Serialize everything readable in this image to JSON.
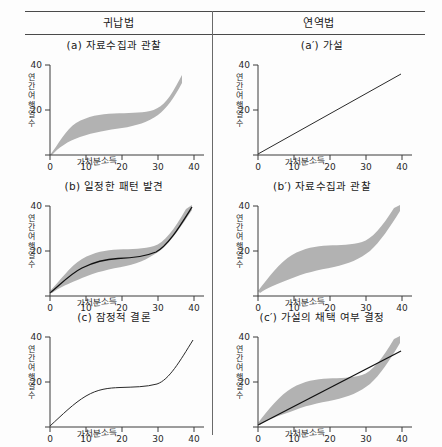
{
  "figure": {
    "columns": [
      {
        "id": "induction",
        "header": "귀납법"
      },
      {
        "id": "deduction",
        "header": "연역법"
      }
    ]
  },
  "panels": [
    {
      "id": "a",
      "column": "induction",
      "row": 1,
      "title": "(a) 자료수집과 관찰",
      "ylabel": "연간여행일수",
      "xlabel": "가처분소득"
    },
    {
      "id": "a-prime",
      "column": "deduction",
      "row": 1,
      "title": "(a′) 가설",
      "ylabel": "연간여행일수",
      "xlabel": "가처분소득"
    },
    {
      "id": "b",
      "column": "induction",
      "row": 2,
      "title": "(b) 일정한 패턴 발견",
      "ylabel": "연간여행일수",
      "xlabel": "가처분소득"
    },
    {
      "id": "b-prime",
      "column": "deduction",
      "row": 2,
      "title": "(b′) 자료수집과 관찰",
      "ylabel": "연간여행일수",
      "xlabel": "가처분소득"
    },
    {
      "id": "c",
      "column": "induction",
      "row": 3,
      "title": "(c) 잠정적 결론",
      "ylabel": "연간여행일수",
      "xlabel": "가처분소득"
    },
    {
      "id": "c-prime",
      "column": "deduction",
      "row": 3,
      "title": "(c′) 가설의 채택 여부 결정",
      "ylabel": "연간여행일수",
      "xlabel": "가처분소득"
    }
  ],
  "chart_data": [
    {
      "panel": "a",
      "type": "area",
      "title": "(a) 자료수집과 관찰",
      "xlabel": "가처분소득",
      "ylabel": "연간여행일수",
      "xlim": [
        0,
        42
      ],
      "ylim": [
        0,
        42
      ],
      "xticks": [
        0,
        10,
        20,
        30,
        40
      ],
      "yticks": [
        20,
        40
      ],
      "grid": false,
      "legend": "none",
      "series": [
        {
          "name": "상한 (upper bound)",
          "x": [
            0,
            5,
            10,
            15,
            20,
            25,
            30,
            35,
            40,
            41
          ],
          "values": [
            0.5,
            11,
            18,
            21,
            22,
            22,
            22,
            24,
            33,
            37
          ]
        },
        {
          "name": "하한 (lower bound)",
          "x": [
            0,
            5,
            10,
            15,
            20,
            25,
            30,
            35,
            40,
            41
          ],
          "values": [
            0,
            5,
            10,
            13,
            14,
            15,
            15.5,
            17,
            27,
            33
          ]
        }
      ]
    },
    {
      "panel": "a-prime",
      "type": "line",
      "title": "(a′) 가설",
      "xlabel": "가처분소득",
      "ylabel": "연간여행일수",
      "xlim": [
        0,
        42
      ],
      "ylim": [
        0,
        42
      ],
      "xticks": [
        0,
        10,
        20,
        30,
        40
      ],
      "yticks": [
        20,
        40
      ],
      "grid": false,
      "legend": "none",
      "series": [
        {
          "name": "가설 직선 (hypothesised linear relation)",
          "x": [
            0,
            10,
            20,
            30,
            40
          ],
          "values": [
            0,
            9,
            18,
            27,
            36
          ]
        }
      ]
    },
    {
      "panel": "b",
      "type": "area",
      "title": "(b) 일정한 패턴 발견",
      "xlabel": "가처분소득",
      "ylabel": "연간여행일수",
      "xlim": [
        0,
        42
      ],
      "ylim": [
        0,
        42
      ],
      "xticks": [
        0,
        10,
        20,
        30,
        40
      ],
      "yticks": [
        20,
        40
      ],
      "grid": false,
      "legend": "none",
      "series": [
        {
          "name": "상한 (upper bound)",
          "x": [
            0,
            5,
            10,
            15,
            20,
            25,
            30,
            35,
            40
          ],
          "values": [
            2.5,
            12,
            19,
            22,
            22.5,
            22.5,
            23,
            29,
            40
          ]
        },
        {
          "name": "하한 (lower bound)",
          "x": [
            0,
            5,
            10,
            15,
            20,
            25,
            30,
            35,
            40
          ],
          "values": [
            2,
            6,
            11,
            13,
            13,
            13,
            14,
            21,
            38
          ]
        },
        {
          "name": "추세선 (fitted pattern)",
          "x": [
            0,
            5,
            10,
            15,
            20,
            25,
            30,
            35,
            40
          ],
          "values": [
            2.2,
            9,
            15,
            17,
            17.3,
            17.5,
            18,
            25,
            39
          ]
        }
      ]
    },
    {
      "panel": "b-prime",
      "type": "area",
      "title": "(b′) 자료수집과 관찰",
      "xlabel": "가처분소득",
      "ylabel": "연간여행일수",
      "xlim": [
        0,
        42
      ],
      "ylim": [
        0,
        42
      ],
      "xticks": [
        0,
        10,
        20,
        30,
        40
      ],
      "yticks": [
        20,
        40
      ],
      "grid": false,
      "legend": "none",
      "series": [
        {
          "name": "상한 (upper bound)",
          "x": [
            0,
            5,
            10,
            15,
            20,
            25,
            30,
            35,
            40
          ],
          "values": [
            2.5,
            14,
            21,
            24,
            24.5,
            24.5,
            25,
            31,
            40
          ]
        },
        {
          "name": "하한 (lower bound)",
          "x": [
            0,
            5,
            10,
            15,
            20,
            25,
            30,
            35,
            40
          ],
          "values": [
            2,
            7,
            11,
            13,
            13,
            13,
            13.5,
            19,
            36
          ]
        }
      ]
    },
    {
      "panel": "c",
      "type": "line",
      "title": "(c) 잠정적 결론",
      "xlabel": "가처분소득",
      "ylabel": "연간여행일수",
      "xlim": [
        0,
        42
      ],
      "ylim": [
        0,
        42
      ],
      "xticks": [
        0,
        10,
        20,
        30,
        40
      ],
      "yticks": [
        20,
        40
      ],
      "grid": false,
      "legend": "none",
      "series": [
        {
          "name": "잠정적 결론 곡선 (tentative conclusion)",
          "x": [
            0,
            5,
            10,
            15,
            20,
            25,
            30,
            35,
            40
          ],
          "values": [
            0.5,
            7,
            13,
            16,
            16.5,
            16.5,
            17,
            25,
            38
          ]
        }
      ]
    },
    {
      "panel": "c-prime",
      "type": "area",
      "title": "(c′) 가설의 채택 여부 결정",
      "xlabel": "가처분소득",
      "ylabel": "연간여행일수",
      "xlim": [
        0,
        42
      ],
      "ylim": [
        0,
        42
      ],
      "xticks": [
        0,
        10,
        20,
        30,
        40
      ],
      "yticks": [
        20,
        40
      ],
      "grid": false,
      "legend": "none",
      "series": [
        {
          "name": "관찰자료 상한 (observed upper bound)",
          "x": [
            0,
            5,
            10,
            15,
            20,
            25,
            30,
            35,
            40
          ],
          "values": [
            2,
            13,
            20,
            23,
            24,
            24,
            25,
            31,
            40
          ]
        },
        {
          "name": "관찰자료 하한 (observed lower bound)",
          "x": [
            0,
            5,
            10,
            15,
            20,
            25,
            30,
            35,
            40
          ],
          "values": [
            1,
            6,
            10,
            12,
            12.5,
            13,
            14,
            21,
            34
          ]
        },
        {
          "name": "가설 직선 (hypothesised linear relation)",
          "x": [
            0,
            10,
            20,
            30,
            40
          ],
          "values": [
            1,
            9,
            17,
            25,
            33
          ]
        }
      ]
    }
  ]
}
